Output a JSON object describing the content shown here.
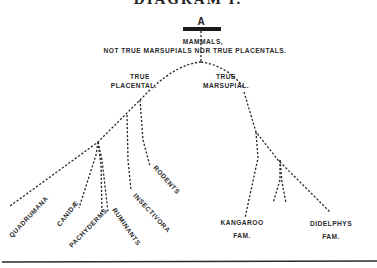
{
  "title": "DIAGRAM I.",
  "root": {
    "letter": "A",
    "label_line1": "MAMMALS,",
    "label_line2": "NOT TRUE MARSUPIALS NOR TRUE PLACENTALS."
  },
  "branches": {
    "placental": {
      "line1": "TRUE",
      "line2": "PLACENTAL."
    },
    "marsupial": {
      "line1": "TRUE",
      "line2": "MARSUPIAL."
    }
  },
  "placental_leaves": [
    {
      "label": "QUADRUMANA"
    },
    {
      "label": "CANIDÆ"
    },
    {
      "label": "PACHYDERMS"
    },
    {
      "label": "RUMINANTS"
    },
    {
      "label": "INSECTIVORA"
    },
    {
      "label": "RODENTS"
    }
  ],
  "marsupial_leaves": [
    {
      "line1": "KANGAROO",
      "line2": "FAM."
    },
    {
      "line1": "DIDELPHYS",
      "line2": "FAM."
    }
  ],
  "colors": {
    "ink": "#2a2a2a",
    "background": "#ffffff"
  }
}
